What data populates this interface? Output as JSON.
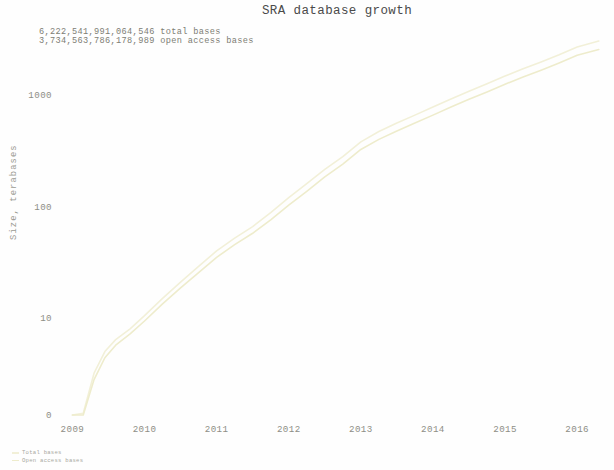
{
  "chart_data": {
    "type": "line",
    "title": "SRA database growth",
    "xlabel": "",
    "ylabel": "Size, terabases",
    "yscale": "log",
    "grid": false,
    "legend_position": "bottom-left",
    "xticks": [
      "2009",
      "2010",
      "2011",
      "2012",
      "2013",
      "2014",
      "2015",
      "2016"
    ],
    "yticks": [
      "0",
      "10",
      "100",
      "1000"
    ],
    "ylim": [
      0,
      3000
    ],
    "xlim": [
      2008.8,
      2016.4
    ],
    "annotations": [
      "6,222,541,991,064,546 total bases",
      "3,734,563,786,178,989 open access bases"
    ],
    "series": [
      {
        "name": "Total bases",
        "color": "#f2f0d8",
        "x": [
          2009.0,
          2009.15,
          2009.3,
          2009.45,
          2009.6,
          2009.8,
          2010.0,
          2010.25,
          2010.5,
          2010.75,
          2011.0,
          2011.25,
          2011.5,
          2011.75,
          2012.0,
          2012.25,
          2012.5,
          2012.75,
          2013.0,
          2013.25,
          2013.5,
          2013.75,
          2014.0,
          2014.25,
          2014.5,
          2014.75,
          2015.0,
          2015.25,
          2015.5,
          2015.75,
          2016.0,
          2016.3
        ],
        "values": [
          0.35,
          1.4,
          3.2,
          5.0,
          6.4,
          8.0,
          10.5,
          15.0,
          21.0,
          29.0,
          40.0,
          52.0,
          66.0,
          88.0,
          120.0,
          160.0,
          215.0,
          280.0,
          380.0,
          470.0,
          560.0,
          660.0,
          780.0,
          920.0,
          1080.0,
          1260.0,
          1480.0,
          1720.0,
          1980.0,
          2300.0,
          2700.0,
          3050.0
        ]
      },
      {
        "name": "Open access bases",
        "color": "#eeeccc",
        "x": [
          2009.0,
          2009.15,
          2009.3,
          2009.45,
          2009.6,
          2009.8,
          2010.0,
          2010.25,
          2010.5,
          2010.75,
          2011.0,
          2011.25,
          2011.5,
          2011.75,
          2012.0,
          2012.25,
          2012.5,
          2012.75,
          2013.0,
          2013.25,
          2013.5,
          2013.75,
          2014.0,
          2014.25,
          2014.5,
          2014.75,
          2015.0,
          2015.25,
          2015.5,
          2015.75,
          2016.0,
          2016.3
        ],
        "values": [
          0.3,
          1.2,
          2.8,
          4.4,
          5.7,
          7.2,
          9.4,
          13.4,
          18.6,
          25.5,
          35.0,
          45.5,
          57.5,
          76.0,
          103.0,
          137.0,
          184.0,
          240.0,
          325.0,
          400.0,
          476.0,
          560.0,
          660.0,
          780.0,
          915.0,
          1065.0,
          1250.0,
          1450.0,
          1670.0,
          1940.0,
          2270.0,
          2560.0
        ]
      }
    ]
  },
  "legend": {
    "items": [
      {
        "label": "Total bases",
        "color": "#f2f0d8"
      },
      {
        "label": "Open access bases",
        "color": "#eeeccc"
      }
    ]
  }
}
